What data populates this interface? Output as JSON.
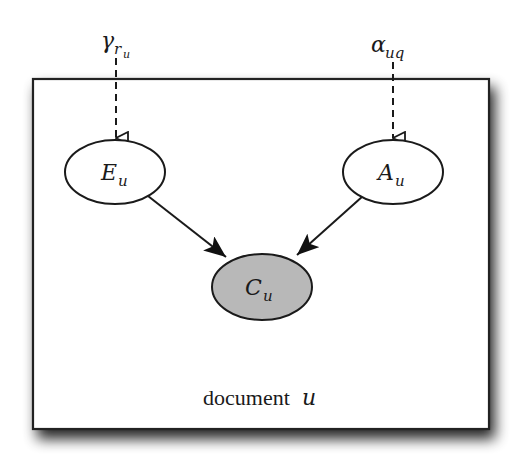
{
  "diagram": {
    "type": "plate-notation-graphical-model",
    "plate": {
      "label_text": "document",
      "label_var": "u"
    },
    "hyperparameters": [
      {
        "id": "gamma",
        "symbol": "γ",
        "sub": "r",
        "subsub": "u",
        "target": "E"
      },
      {
        "id": "alpha",
        "symbol": "α",
        "sub": "uq",
        "target": "A"
      }
    ],
    "nodes": [
      {
        "id": "E",
        "symbol": "E",
        "sub": "u",
        "observed": false
      },
      {
        "id": "A",
        "symbol": "A",
        "sub": "u",
        "observed": false
      },
      {
        "id": "C",
        "symbol": "C",
        "sub": "u",
        "observed": true
      }
    ],
    "edges": [
      {
        "from": "gamma",
        "to": "E",
        "style": "dashed"
      },
      {
        "from": "alpha",
        "to": "A",
        "style": "dashed"
      },
      {
        "from": "E",
        "to": "C",
        "style": "solid"
      },
      {
        "from": "A",
        "to": "C",
        "style": "solid"
      }
    ],
    "colors": {
      "stroke": "#1a1a1a",
      "observed_fill": "#b8b8b8",
      "latent_fill": "#ffffff",
      "background": "#ffffff"
    }
  }
}
